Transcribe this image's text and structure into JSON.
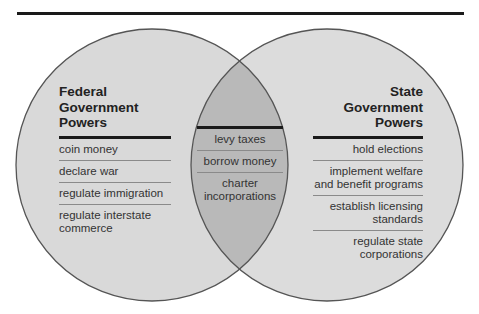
{
  "diagram": {
    "type": "venn",
    "colors": {
      "circle_fill": "#d8d8d8",
      "overlap_fill": "#b8b8b8",
      "circle_stroke": "#555555",
      "rule": "#1a1a1a"
    },
    "left": {
      "title_lines": [
        "Federal",
        "Government",
        "Powers"
      ],
      "items": [
        "coin money",
        "declare war",
        "regulate immigration",
        "regulate interstate commerce"
      ]
    },
    "overlap": {
      "items": [
        "levy taxes",
        "borrow money",
        "charter incorporations"
      ]
    },
    "right": {
      "title_lines": [
        "State",
        "Government",
        "Powers"
      ],
      "items": [
        "hold elections",
        "implement welfare and benefit programs",
        "establish licensing standards",
        "regulate state corporations"
      ]
    }
  }
}
